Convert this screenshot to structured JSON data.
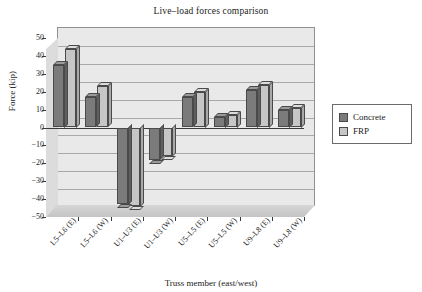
{
  "chart_data": {
    "type": "bar",
    "title": "Live–load forces comparison",
    "xlabel": "Truss member (east/west)",
    "ylabel": "Force (kip)",
    "ylim": [
      -50,
      50
    ],
    "yticks": [
      50,
      40,
      30,
      20,
      10,
      0,
      -10,
      -20,
      -30,
      -40,
      -50
    ],
    "ytick_labels": [
      "50",
      "40",
      "30",
      "20",
      "10",
      "0",
      "−10",
      "−20",
      "−30",
      "−40",
      "−50"
    ],
    "grid": true,
    "legend_position": "right",
    "categories": [
      "L5–L6 (E)",
      "L5–L6 (W)",
      "U1–U3 (E)",
      "U1–U3 (W)",
      "U5–L5 (E)",
      "U5–L5 (W)",
      "U9–L8 (E)",
      "U9–L8 (W)"
    ],
    "series": [
      {
        "name": "Concrete",
        "color": "#7b7b7b",
        "values": [
          35,
          17,
          -43,
          -18,
          17,
          6,
          21,
          10
        ]
      },
      {
        "name": "FRP",
        "color": "#c6c6c6",
        "values": [
          44,
          23,
          -44,
          -16,
          20,
          7,
          24,
          11
        ]
      }
    ]
  },
  "legend": {
    "items": [
      {
        "label": "Concrete",
        "swatch_class": "sw-concrete"
      },
      {
        "label": "FRP",
        "swatch_class": "sw-frp"
      }
    ]
  }
}
